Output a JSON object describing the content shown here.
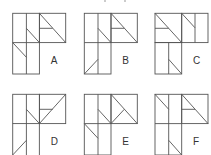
{
  "figures": [
    {
      "label": "A",
      "x": 12.7,
      "y": 13.3
    },
    {
      "label": "B",
      "x": 84.3,
      "y": 13.3
    },
    {
      "label": "C",
      "x": 155,
      "y": 13.3
    },
    {
      "label": "D",
      "x": 12.7,
      "y": 94.3
    },
    {
      "label": "E",
      "x": 84.3,
      "y": 94.3
    },
    {
      "label": "F",
      "x": 155,
      "y": 94.3
    }
  ]
}
